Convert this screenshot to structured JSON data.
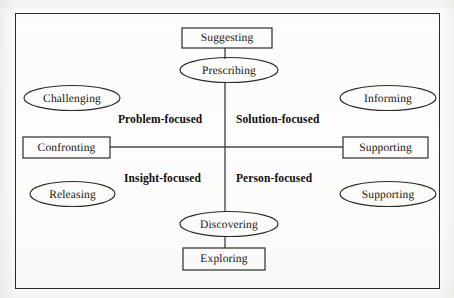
{
  "figure": {
    "kind": "quadrant-matrix-diagram",
    "frame": {
      "stroke_color": "#2a2a2a"
    },
    "axes": {
      "vertical_line": true,
      "horizontal_line": true,
      "stroke_color": "#4a4a4a",
      "center_x": 225,
      "center_y": 147
    },
    "quadrant_labels": {
      "top_left": "Problem-focused",
      "top_right": "Solution-focused",
      "bottom_left": "Insight-focused",
      "bottom_right": "Person-focused"
    },
    "nodes": {
      "top_box": {
        "label": "Suggesting",
        "shape": "rectangle"
      },
      "top_ellipse": {
        "label": "Prescribing",
        "shape": "ellipse"
      },
      "left_upper_ellipse": {
        "label": "Challenging",
        "shape": "ellipse"
      },
      "left_box": {
        "label": "Confronting",
        "shape": "rectangle"
      },
      "left_lower_ellipse": {
        "label": "Releasing",
        "shape": "ellipse"
      },
      "right_upper_ellipse": {
        "label": "Informing",
        "shape": "ellipse"
      },
      "right_box": {
        "label": "Supporting",
        "shape": "rectangle"
      },
      "right_lower_ellipse": {
        "label": "Supporting",
        "shape": "ellipse"
      },
      "bottom_ellipse": {
        "label": "Discovering",
        "shape": "ellipse"
      },
      "bottom_box": {
        "label": "Exploring",
        "shape": "rectangle"
      }
    }
  }
}
